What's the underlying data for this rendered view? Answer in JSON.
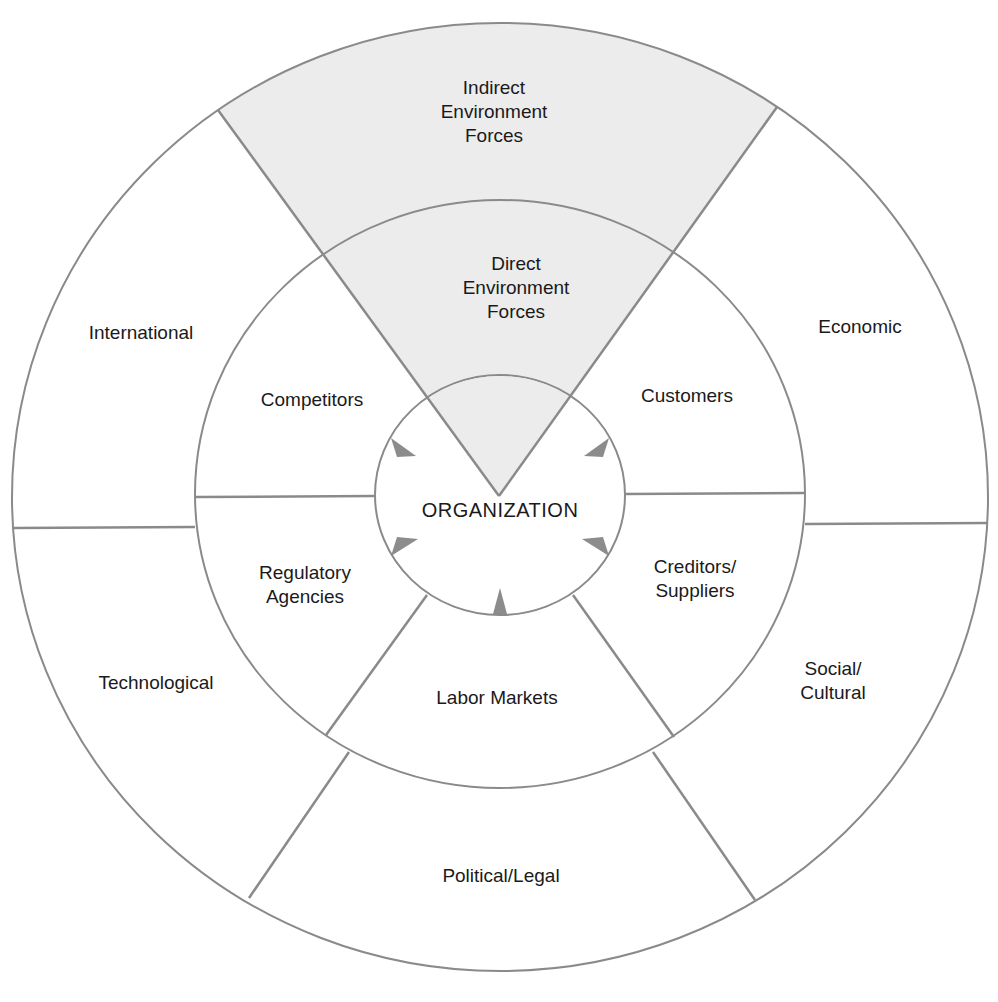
{
  "diagram": {
    "type": "concentric-rings",
    "center_label": "ORGANIZATION",
    "wedge": {
      "fill_color": "#ececec",
      "outer_label": [
        "Indirect",
        "Environment",
        "Forces"
      ],
      "inner_label": [
        "Direct",
        "Environment",
        "Forces"
      ]
    },
    "direct_forces": [
      {
        "id": "competitors",
        "label": [
          "Competitors"
        ]
      },
      {
        "id": "customers",
        "label": [
          "Customers"
        ]
      },
      {
        "id": "regulatory-agencies",
        "label": [
          "Regulatory",
          "Agencies"
        ]
      },
      {
        "id": "creditors-suppliers",
        "label": [
          "Creditors/",
          "Suppliers"
        ]
      },
      {
        "id": "labor-markets",
        "label": [
          "Labor Markets"
        ]
      }
    ],
    "indirect_forces": [
      {
        "id": "international",
        "label": [
          "International"
        ]
      },
      {
        "id": "economic",
        "label": [
          "Economic"
        ]
      },
      {
        "id": "technological",
        "label": [
          "Technological"
        ]
      },
      {
        "id": "social-cultural",
        "label": [
          "Social/",
          "Cultural"
        ]
      },
      {
        "id": "political-legal",
        "label": [
          "Political/Legal"
        ]
      }
    ],
    "line_color": "#8a8a8a",
    "arrow_color": "#8c8c8c"
  }
}
